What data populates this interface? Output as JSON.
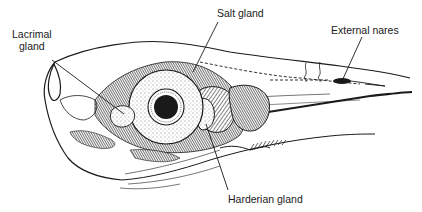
{
  "diagram": {
    "colors": {
      "ink": "#1a1a1a",
      "background": "#ffffff"
    },
    "labels": [
      {
        "id": "lacrimal",
        "line1": "Lacrimal",
        "line2": "gland",
        "x": 14,
        "y": 28
      },
      {
        "id": "salt",
        "text": "Salt gland",
        "x": 216,
        "y": 7
      },
      {
        "id": "nares",
        "text": "External nares",
        "x": 330,
        "y": 24
      },
      {
        "id": "harderian",
        "text": "Harderian gland",
        "x": 228,
        "y": 194
      }
    ]
  }
}
